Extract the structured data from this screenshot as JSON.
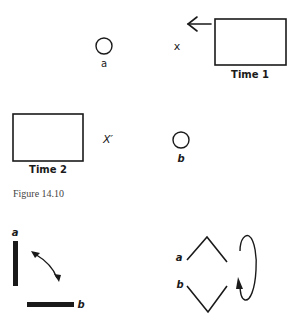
{
  "figure": {
    "caption": "Figure 14.10"
  },
  "top_diagram": {
    "time1_label": "Time 1",
    "time2_label": "Time 2",
    "circle_a_label": "a",
    "circle_b_label": "b",
    "x_label": "x",
    "x_prime_label": "X′",
    "arrow_direction": "left"
  },
  "bottom_left_diagram": {
    "vertical_bar_label": "a",
    "horizontal_bar_label": "b",
    "arrow": "double-headed curved"
  },
  "bottom_right_diagram": {
    "upper_chevron_label": "a",
    "lower_chevron_label": "b",
    "loop_arrow": "clockwise loop"
  },
  "colors": {
    "ink": "#1a1a1a",
    "background": "#ffffff",
    "caption": "#444444"
  }
}
